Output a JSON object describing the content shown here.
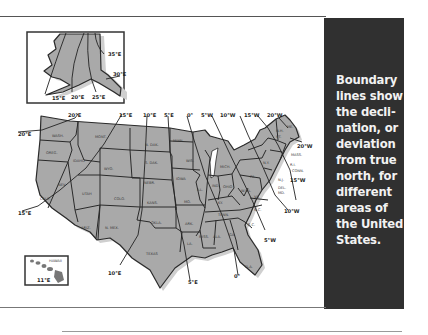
{
  "caption": {
    "lines": [
      "Boundary",
      "lines show",
      "the decli-",
      "nation, or",
      "deviation",
      "from true",
      "north, for",
      "different",
      "areas of",
      "the United",
      "States."
    ]
  },
  "colors": {
    "panel_bg": "#303030",
    "panel_text": "#f2f2f2",
    "land": "#a9a9a9",
    "border": "#2a2a2a"
  },
  "map": {
    "alaska_labels": {
      "e35": "35°E",
      "e30": "30°E",
      "e15": "15°E",
      "e20": "20°E",
      "e25": "25°E"
    },
    "hawaii_labels": {
      "name": "HAWAII",
      "e11": "11°E"
    },
    "top_labels": {
      "e20": "20°E",
      "e15": "15°E",
      "e10": "10°E",
      "e5": "5°E",
      "zero": "0°",
      "w5": "5°W",
      "w10": "10°W",
      "w15": "15°W",
      "w20": "20°W"
    },
    "side_labels": {
      "west_e20": "20°E",
      "west_e15": "15°E",
      "east_w20": "20°W",
      "east_w15": "15°W",
      "east_w10": "10°W",
      "east_w5": "5°W"
    },
    "bottom_labels": {
      "e10": "10°E",
      "e5": "5°E",
      "zero": "0°"
    },
    "states": {
      "wash": "WASH.",
      "oreg": "OREG.",
      "idaho": "IDAHO",
      "mont": "MONT.",
      "wyo": "WYO.",
      "calif": "CALIF.",
      "nev": "NEV.",
      "utah": "UTAH",
      "colo": "COLO.",
      "ariz": "ARIZ.",
      "nmex": "N. MEX.",
      "ndak": "N. DAK.",
      "sdak": "S. DAK.",
      "nebr": "NEBR.",
      "kans": "KANS.",
      "okla": "OKLA.",
      "texas": "TEXAS",
      "minn": "MINN.",
      "iowa": "IOWA",
      "mo": "MO.",
      "ark": "ARK.",
      "la": "LA.",
      "wis": "WIS.",
      "ill": "ILL.",
      "mich": "MICH.",
      "ind": "IND.",
      "ohio": "OHIO",
      "ky": "KY.",
      "tenn": "TENN.",
      "miss": "MISS.",
      "ala": "ALA.",
      "ga": "GA.",
      "fla": "FLA.",
      "sc": "S.C.",
      "nc": "N.C.",
      "va": "VA.",
      "wva": "W.VA.",
      "pa": "PA.",
      "ny": "N.Y.",
      "vt": "VT.",
      "nh": "N.H.",
      "me": "ME.",
      "mass": "MASS.",
      "ri": "R.I.",
      "conn": "CONN.",
      "nj": "N.J.",
      "del": "DEL.",
      "md": "MD."
    }
  }
}
